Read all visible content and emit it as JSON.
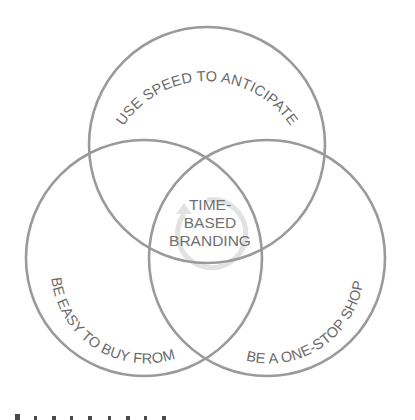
{
  "diagram": {
    "type": "venn",
    "circles": [
      {
        "id": "top",
        "label": "USE SPEED TO ANTICIPATE",
        "cx": 207,
        "cy": 145,
        "r": 118
      },
      {
        "id": "left",
        "label": "BE EASY TO BUY FROM",
        "cx": 144,
        "cy": 258,
        "r": 118
      },
      {
        "id": "right",
        "label": "BE A ONE-STOP SHOP",
        "cx": 267,
        "cy": 258,
        "r": 118
      }
    ],
    "center": {
      "lines": [
        "TIME-",
        "BASED",
        "BRANDING"
      ],
      "icon": "cycle-arrow-icon"
    },
    "colors": {
      "stroke": "#9a9a9a",
      "text": "#6a6a6a",
      "cycle": "#e2e2e2"
    }
  }
}
